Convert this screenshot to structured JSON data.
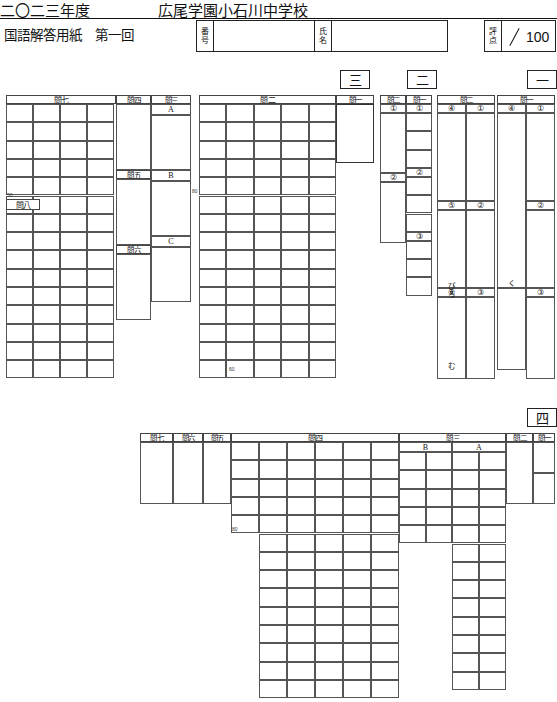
{
  "header": {
    "year": "二〇二三年度",
    "school": "広尾学園小石川中学校",
    "sheet_title": "国語解答用紙　第一回",
    "id_label_top": "番",
    "id_label_bottom": "号",
    "name_label_top": "氏",
    "name_label_bottom": "名",
    "id_value": "",
    "name_value": "",
    "score_label_top": "評",
    "score_label_bottom": "点",
    "score_value": "",
    "score_max": "100"
  },
  "section_badges": {
    "one": "一",
    "two": "二",
    "three": "三",
    "four": "四"
  },
  "section_one": {
    "q7_label": "問七",
    "q8_label": "問八",
    "q4_label": "問四",
    "q5_label": "問五",
    "q6_label": "問六",
    "q3_label": "問三",
    "q3_sub": [
      "A",
      "B",
      "C"
    ],
    "q2_label": "問二",
    "q1_label": "問一",
    "count_50": "50",
    "count_80_left": "80",
    "count_80_right": "80",
    "count_60": "60"
  },
  "section_two": {
    "q2_label": "問二",
    "q1_label": "問一",
    "left_numbers": [
      "①",
      "②"
    ],
    "right_numbers": [
      "①",
      "②",
      "③"
    ]
  },
  "section_three": {
    "q2_label": "問二",
    "q1_label": "問一",
    "col1_numbers": [
      "④",
      "⑤",
      "⑥"
    ],
    "col2_numbers": [
      "①",
      "②",
      "③"
    ],
    "col3_numbers": [
      "④"
    ],
    "col4_numbers": [
      "①",
      "②",
      "③"
    ],
    "hints": {
      "col1_mid": "びろ",
      "col1_low": "む",
      "col1_bottom": "る",
      "col3_mid": "く",
      "col4_bottom": "ねる"
    }
  },
  "section_four": {
    "q7_label": "問七",
    "q6_label": "問六",
    "q5_label": "問五",
    "q4_label": "問四",
    "q3_label": "問三",
    "q3_sub": [
      "B",
      "A"
    ],
    "q2_label": "問二",
    "q1_label": "問一",
    "count_80": "80"
  }
}
